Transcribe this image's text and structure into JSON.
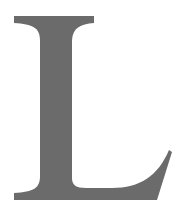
{
  "glyph": {
    "character": "L",
    "style": "serif",
    "fill_color": "#6b6b6b",
    "background_color": "#ffffff"
  }
}
